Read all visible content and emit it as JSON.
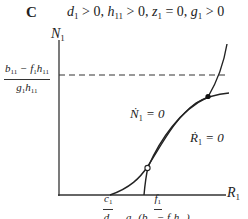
{
  "figure": {
    "panel_letter": "C",
    "conditions": "d1 > 0, h11 > 0, z1 = 0, g1 > 0",
    "y_axis_label": "N1",
    "x_axis_label": "R1",
    "dashed_level_label": {
      "numerator": "b11 − f1h11",
      "denominator": "g1h11"
    },
    "x_tick_1": {
      "numerator": "c1",
      "denominator": "d1"
    },
    "x_tick_2": {
      "numerator": "f1",
      "denominator": "a11(b11 − f1h11)"
    },
    "isoclines": [
      {
        "name": "N1 nullcline",
        "label": "Ṅ1 = 0"
      },
      {
        "name": "R1 nullcline",
        "label": "Ṙ1 = 0"
      }
    ],
    "equilibria": [
      {
        "type": "unstable",
        "marker": "open circle"
      },
      {
        "type": "stable",
        "marker": "filled circle"
      }
    ]
  }
}
